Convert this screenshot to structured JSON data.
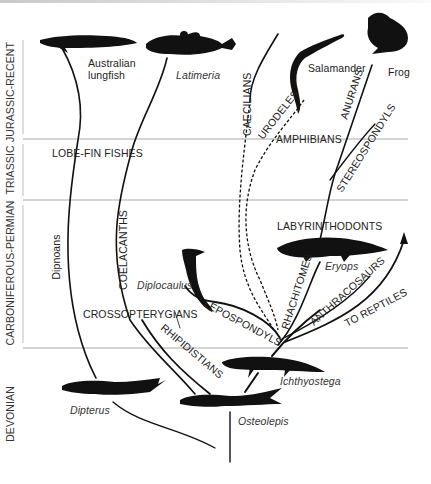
{
  "diagram": {
    "periods": [
      {
        "label": "JURASSIC-RECENT"
      },
      {
        "label": "TRIASSIC"
      },
      {
        "label": "CARBONIFEROUS-PERMIAN"
      },
      {
        "label": "DEVONIAN"
      }
    ],
    "groups": {
      "lobe_fin": "LOBE-FIN  FISHES",
      "dipnoans": "Dipnoans",
      "coelacanths": "COELACANTHS",
      "crossopterygians": "CROSSOPTERYGIANS",
      "rhipidistians": "RHIPIDISTIANS",
      "caecilians": "CAECILIANS",
      "urodeles": "URODELES",
      "amphibians": "AMPHIBIANS",
      "anurans": "ANURANS",
      "stereospondyls": "STEREOSPONDYLS",
      "labyrinthodonts": "LABYRINTHODONTS",
      "lepospondyls": "LEPOSPONDYLS",
      "rhachitomes": "RHACHITOMES",
      "anthracosaurs": "ANTHRACOSAURS",
      "to_reptiles": "TO REPTILES"
    },
    "animals": {
      "australian_lungfish_1": "Australian",
      "australian_lungfish_2": "lungfish",
      "latimeria": "Latimeria",
      "salamander": "Salamander",
      "frog": "Frog",
      "diplocaulus": "Diplocaulus",
      "eryops": "Eryops",
      "ichthyostega": "Ichthyostega",
      "osteolepis": "Osteolepis",
      "dipterus": "Dipterus"
    },
    "colors": {
      "ink": "#111111",
      "rule": "#999999",
      "text": "#222222"
    }
  }
}
